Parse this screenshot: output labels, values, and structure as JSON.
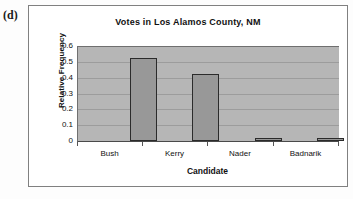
{
  "figure": {
    "label": "(d)"
  },
  "chart_data": {
    "type": "bar",
    "title": "Votes in Los Alamos County, NM",
    "xlabel": "Candidate",
    "ylabel": "Relative Frequency",
    "categories": [
      "Bush",
      "Kerry",
      "Nader",
      "Badnarik"
    ],
    "values": [
      0.525,
      0.425,
      0.02,
      0.02
    ],
    "ylim": [
      0,
      0.6
    ],
    "yticks": [
      0,
      0.1,
      0.2,
      0.3,
      0.4,
      0.5,
      0.6
    ],
    "ytick_labels": [
      "0",
      "0.1",
      "0.2",
      "0.3",
      "0.4",
      "0.5",
      "0.6"
    ],
    "grid": true,
    "legend": false,
    "colors": {
      "bar_fill": "#989898",
      "bar_border": "#2b2b2b",
      "plot_background": "#b6b6b6",
      "gridline": "#9c9c9c",
      "text": "#111111",
      "frame": "#808080"
    }
  }
}
